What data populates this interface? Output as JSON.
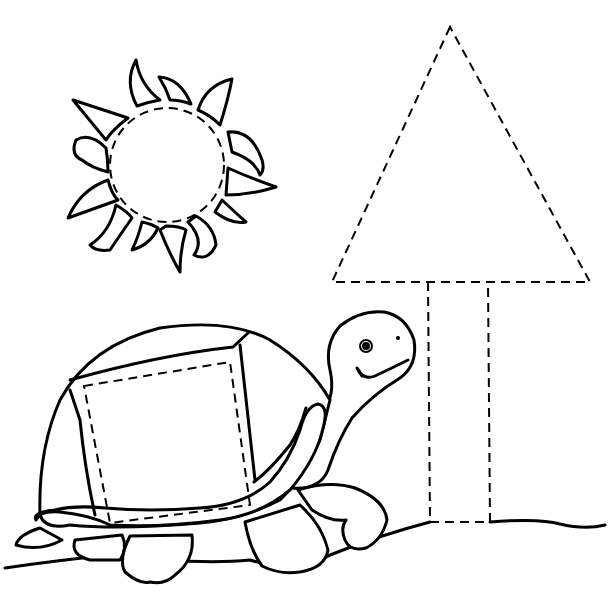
{
  "worksheet": {
    "type": "shape tracing worksheet",
    "background": "#ffffff",
    "ink": "#000000",
    "shapes_to_trace": [
      {
        "name": "circle",
        "location": "sun",
        "center": [
          167,
          165
        ],
        "radius": 57
      },
      {
        "name": "square",
        "location": "turtle shell",
        "corners": [
          [
            84,
            386
          ],
          [
            230,
            362
          ],
          [
            250,
            505
          ],
          [
            110,
            523
          ]
        ]
      },
      {
        "name": "triangle",
        "location": "tree top",
        "points": [
          [
            450,
            27
          ],
          [
            332,
            282
          ],
          [
            590,
            282
          ]
        ]
      },
      {
        "name": "rectangle",
        "location": "tree trunk",
        "x": 428,
        "y": 282,
        "width": 60,
        "height": 240
      }
    ],
    "figures": [
      {
        "name": "sun",
        "rays": 12
      },
      {
        "name": "turtle",
        "expression": "smiling"
      },
      {
        "name": "ground-line"
      }
    ]
  }
}
